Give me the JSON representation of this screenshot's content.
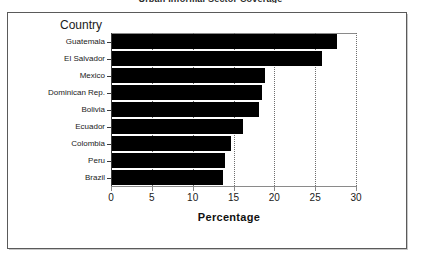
{
  "document": {
    "title_clipped": "Urban Informal Sector Coverage"
  },
  "chart_data": {
    "type": "bar",
    "orientation": "horizontal",
    "title": "",
    "xlabel": "Percentage",
    "ylabel": "Country",
    "categories": [
      "Guatemala",
      "El Salvador",
      "Mexico",
      "Dominican Rep.",
      "Bolivia",
      "Ecuador",
      "Colombia",
      "Peru",
      "Brazil"
    ],
    "values": [
      27.5,
      25.7,
      18.7,
      18.4,
      18.0,
      16.0,
      14.6,
      13.8,
      13.6
    ],
    "xlim": [
      0,
      30
    ],
    "xticks": [
      0,
      5,
      10,
      15,
      20,
      25,
      30
    ],
    "xtick_labels": [
      "0",
      "5",
      "10",
      "15",
      "20",
      "25",
      "30"
    ],
    "grid": "vertical-dotted",
    "legend": "none",
    "bar_color": "#000000",
    "plot_background": "#ffffff",
    "frame_color": "#5a5a5a"
  }
}
